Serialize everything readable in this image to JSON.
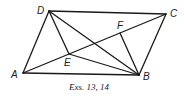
{
  "diagram": {
    "points": {
      "A": {
        "label": "A",
        "x": 23,
        "y": 73
      },
      "B": {
        "label": "B",
        "x": 139,
        "y": 75
      },
      "C": {
        "label": "C",
        "x": 166,
        "y": 14
      },
      "D": {
        "label": "D",
        "x": 49,
        "y": 11
      },
      "E": {
        "label": "E",
        "x": 69,
        "y": 54
      },
      "F": {
        "label": "F",
        "x": 120,
        "y": 33
      }
    },
    "segments": [
      "AB",
      "BC",
      "CD",
      "DA",
      "AC",
      "DB",
      "DE",
      "EB",
      "DF",
      "FB"
    ],
    "caption": "Exs. 13, 14"
  }
}
